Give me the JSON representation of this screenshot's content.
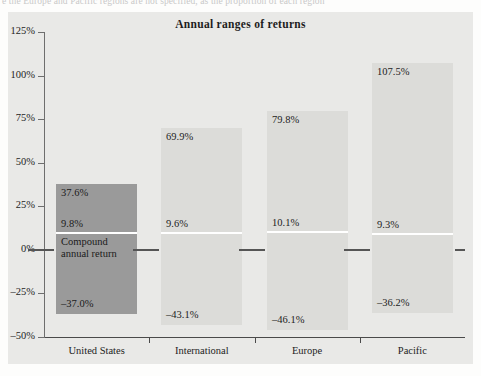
{
  "page": {
    "top_text_fragment": "e the Europe and Pacific regions are not specified, as the proportion of each region"
  },
  "chart_data": {
    "type": "bar",
    "title": "Annual ranges of returns",
    "xlabel": "",
    "ylabel": "",
    "ylim": [
      -50,
      125
    ],
    "ytick_labels": [
      "125%",
      "100%",
      "75%",
      "50%",
      "25%",
      "0%",
      "-25%",
      "-50%"
    ],
    "ytick_values": [
      125,
      100,
      75,
      50,
      25,
      0,
      -25,
      -50
    ],
    "grid": false,
    "legend": "none",
    "annotation": "Compound annual return",
    "categories": [
      "United States",
      "International",
      "Europe",
      "Pacific"
    ],
    "series": [
      {
        "name": "Best annual return",
        "values": [
          37.6,
          69.9,
          79.8,
          107.5
        ]
      },
      {
        "name": "Compound annual return",
        "values": [
          9.8,
          9.6,
          10.1,
          9.3
        ]
      },
      {
        "name": "Worst annual return",
        "values": [
          -37.0,
          -43.1,
          -46.1,
          -36.2
        ]
      }
    ],
    "bars": [
      {
        "category": "United States",
        "high": 37.6,
        "high_label": "37.6%",
        "compound": 9.8,
        "compound_label": "9.8%",
        "low": -37.0,
        "low_label": "-37.0%",
        "highlighted": true
      },
      {
        "category": "International",
        "high": 69.9,
        "high_label": "69.9%",
        "compound": 9.6,
        "compound_label": "9.6%",
        "low": -43.1,
        "low_label": "-43.1%",
        "highlighted": false
      },
      {
        "category": "Europe",
        "high": 79.8,
        "high_label": "79.8%",
        "compound": 10.1,
        "compound_label": "10.1%",
        "low": -46.1,
        "low_label": "-46.1%",
        "highlighted": false
      },
      {
        "category": "Pacific",
        "high": 107.5,
        "high_label": "107.5%",
        "compound": 9.3,
        "compound_label": "9.3%",
        "low": -36.2,
        "low_label": "-36.2%",
        "highlighted": false
      }
    ],
    "colors": {
      "panel_background": "#e9e9e7",
      "bar_default": "#dcdcd9",
      "bar_highlight": "#9a9a9a",
      "split_line": "#ffffff",
      "axis": "#4a4a4a",
      "text": "#1d1d1d"
    }
  }
}
